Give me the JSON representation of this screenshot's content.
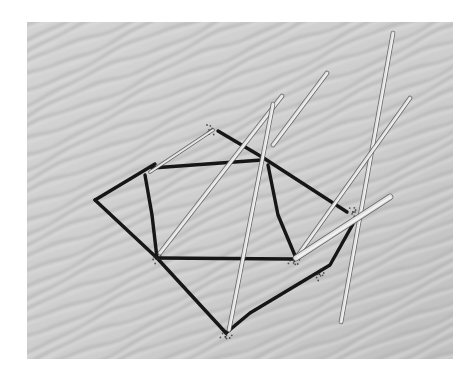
{
  "image": {
    "description": "Black-and-white photograph of sticks and dark drawn lines forming overlapping geometric shapes on rippled desert sand",
    "frame": {
      "x": 27,
      "y": 22,
      "width": 426,
      "height": 337
    },
    "colors": {
      "page_background": "#ffffff",
      "sand": "#d2d2d2",
      "ripple_shadow": "#a9a9a9",
      "ripple_highlight": "#e4e4e4",
      "drawn_line": "#151515",
      "stick": "#e2e2e2",
      "stick_edge": "#5a5a5a"
    },
    "drawn_lines": [
      {
        "name": "outer-left-upper",
        "points": [
          [
            95,
            200
          ],
          [
            155,
            164
          ]
        ]
      },
      {
        "name": "outer-left-lower",
        "points": [
          [
            95,
            200
          ],
          [
            157,
            258
          ],
          [
            226,
            333
          ]
        ]
      },
      {
        "name": "outer-right-lower",
        "points": [
          [
            226,
            333
          ],
          [
            250,
            313
          ],
          [
            330,
            265
          ],
          [
            353,
            224
          ]
        ]
      },
      {
        "name": "outer-top-right",
        "points": [
          [
            218,
            131
          ],
          [
            262,
            157
          ],
          [
            347,
            212
          ]
        ]
      },
      {
        "name": "inner-top",
        "points": [
          [
            152,
            168
          ],
          [
            262,
            160
          ]
        ]
      },
      {
        "name": "inner-left",
        "points": [
          [
            145,
            175
          ],
          [
            152,
            215
          ],
          [
            157,
            258
          ]
        ]
      },
      {
        "name": "inner-bottom",
        "points": [
          [
            157,
            258
          ],
          [
            293,
            259
          ]
        ]
      },
      {
        "name": "inner-right",
        "points": [
          [
            268,
            165
          ],
          [
            278,
            215
          ],
          [
            296,
            258
          ]
        ]
      }
    ],
    "sticks": [
      {
        "name": "stick-diagonal-a",
        "from": [
          282,
          96
        ],
        "to": [
          160,
          253
        ],
        "width": 3
      },
      {
        "name": "stick-diagonal-b",
        "from": [
          327,
          73
        ],
        "to": [
          273,
          145
        ],
        "width": 3
      },
      {
        "name": "stick-long-vertical",
        "from": [
          273,
          104
        ],
        "to": [
          229,
          330
        ],
        "width": 3
      },
      {
        "name": "stick-tall-right",
        "from": [
          393,
          33
        ],
        "to": [
          341,
          322
        ],
        "width": 3
      },
      {
        "name": "stick-right-diagonal",
        "from": [
          410,
          98
        ],
        "to": [
          296,
          258
        ],
        "width": 3
      },
      {
        "name": "stick-short-thick",
        "from": [
          390,
          197
        ],
        "to": [
          296,
          258
        ],
        "width": 5
      },
      {
        "name": "stick-faint-left",
        "from": [
          213,
          130
        ],
        "to": [
          150,
          172
        ],
        "width": 2
      }
    ],
    "debris_clusters": [
      [
        210,
        130
      ],
      [
        157,
        258
      ],
      [
        226,
        336
      ],
      [
        354,
        212
      ],
      [
        320,
        275
      ],
      [
        294,
        262
      ]
    ]
  }
}
